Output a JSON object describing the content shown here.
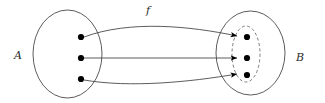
{
  "figure": {
    "kind": "set-mapping-diagram",
    "width": 325,
    "height": 103,
    "background_color": "#ffffff",
    "stroke_color": "#4a4a4a",
    "point_color": "#000000",
    "dashed_color": "#6d6d6d"
  },
  "labels": {
    "domain_set": "A",
    "codomain_set": "B",
    "map": "f"
  },
  "domain": {
    "name": "A",
    "ellipse": {
      "cx": 67.5,
      "cy": 54,
      "rx": 34.5,
      "ry": 44
    },
    "label_position": {
      "x": 18,
      "y": 59
    },
    "points": [
      {
        "id": "a1",
        "x": 81,
        "y": 37
      },
      {
        "id": "a2",
        "x": 81,
        "y": 58
      },
      {
        "id": "a3",
        "x": 81,
        "y": 79
      }
    ]
  },
  "codomain": {
    "name": "B",
    "ellipse": {
      "cx": 250.5,
      "cy": 53,
      "rx": 34.5,
      "ry": 42
    },
    "label_position": {
      "x": 300,
      "y": 61
    },
    "points": [
      {
        "id": "b1",
        "x": 247,
        "y": 37
      },
      {
        "id": "b2",
        "x": 247,
        "y": 58
      },
      {
        "id": "b3",
        "x": 247,
        "y": 75
      }
    ]
  },
  "image_subset": {
    "description": "dashed ellipse marking the image of f inside B",
    "ellipse": {
      "cx": 246,
      "cy": 54,
      "rx": 14,
      "ry": 28
    },
    "dash_pattern": "3 2.4"
  },
  "map_label": {
    "text": "f",
    "position": {
      "x": 148,
      "y": 14
    }
  },
  "arrows": [
    {
      "id": "arrow-a1-b1",
      "from": "a1",
      "to": "b1",
      "path": "M 84 37 C 130 20 190 26 237 36",
      "style": "curved-up"
    },
    {
      "id": "arrow-a2-b2",
      "from": "a2",
      "to": "b2",
      "path": "M 84 58 L 237 58",
      "style": "straight"
    },
    {
      "id": "arrow-a3-b3",
      "from": "a3",
      "to": "b3",
      "path": "M 84 80 C 130 88 190 82 237 74",
      "style": "curved-down"
    }
  ],
  "point_radius": 3.1,
  "arrowhead": {
    "length": 6.5,
    "width": 5
  }
}
